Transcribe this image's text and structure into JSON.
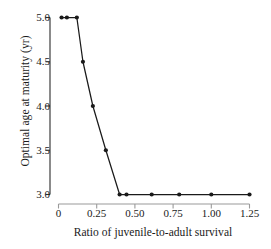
{
  "chart_data": {
    "type": "line",
    "title": "",
    "xlabel": "Ratio of juvenile-to-adult survival",
    "ylabel": "Optimal age at maturity (yr)",
    "xlim": [
      0.0,
      1.25
    ],
    "ylim": [
      3.0,
      5.0
    ],
    "xticks": [
      0,
      0.25,
      0.5,
      0.75,
      1.0,
      1.25
    ],
    "xtick_labels": [
      "0",
      "0.25",
      "0.50",
      "0.75",
      "1.00",
      "1.25"
    ],
    "yticks": [
      3.0,
      3.5,
      4.0,
      4.5,
      5.0
    ],
    "ytick_labels": [
      "3.0",
      "3.5",
      "4.0",
      "4.5",
      "5.0"
    ],
    "grid": false,
    "legend": null,
    "marker": "filled-circle",
    "line_color": "#1a1a1a",
    "marker_color": "#1a1a1a",
    "background": "#ffffff",
    "series": [
      {
        "name": "Optimal age at maturity",
        "x": [
          0.02,
          0.055,
          0.12,
          0.16,
          0.225,
          0.31,
          0.4,
          0.445,
          0.61,
          0.79,
          1.0,
          1.25
        ],
        "y": [
          5.0,
          5.0,
          5.0,
          4.5,
          4.0,
          3.5,
          3.0,
          3.0,
          3.0,
          3.0,
          3.0,
          3.0
        ]
      }
    ]
  }
}
